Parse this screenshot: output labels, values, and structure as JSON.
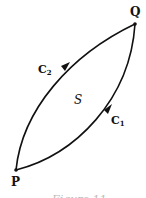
{
  "diagram": {
    "points": [
      {
        "id": "P",
        "label": "P"
      },
      {
        "id": "Q",
        "label": "Q"
      }
    ],
    "curves": [
      {
        "id": "C1",
        "label_main": "C",
        "label_sub": "1",
        "from": "P",
        "to": "Q",
        "direction": "P-to-Q"
      },
      {
        "id": "C2",
        "label_main": "C",
        "label_sub": "2",
        "from": "P",
        "to": "Q",
        "direction": "P-to-Q"
      }
    ],
    "region_label": "S",
    "caption": "Figure 11",
    "colors": {
      "stroke": "#111111",
      "background": "#ffffff"
    }
  }
}
